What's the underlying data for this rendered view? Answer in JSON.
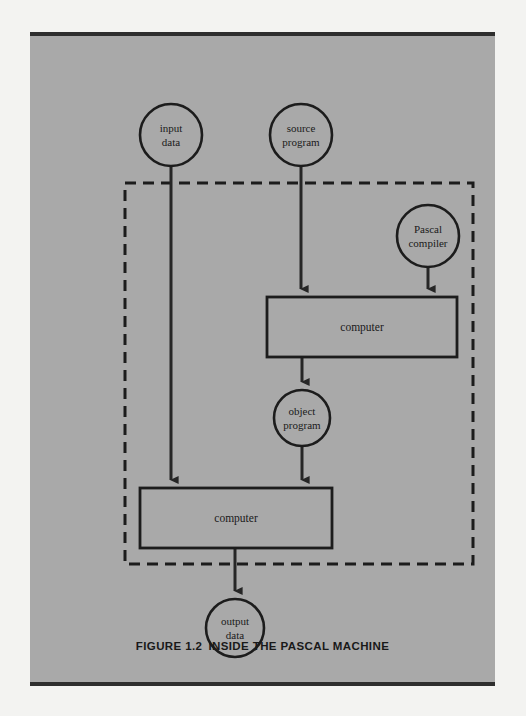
{
  "figure": {
    "caption_number": "FIGURE 1.2",
    "caption_title": "INSIDE THE PASCAL MACHINE",
    "panel_color": "#a9a9a9",
    "ink_color": "#1c1c1c",
    "page_color": "#f3f3f1"
  },
  "diagram": {
    "type": "flowchart",
    "nodes": [
      {
        "id": "input-data",
        "shape": "circle",
        "label_line1": "input",
        "label_line2": "data",
        "cx": 141,
        "cy": 99,
        "r": 31
      },
      {
        "id": "source-program",
        "shape": "circle",
        "label_line1": "source",
        "label_line2": "program",
        "cx": 271,
        "cy": 99,
        "r": 31
      },
      {
        "id": "pascal-compiler",
        "shape": "circle",
        "label_line1": "Pascal",
        "label_line2": "compiler",
        "cx": 398,
        "cy": 200,
        "r": 31
      },
      {
        "id": "computer-upper",
        "shape": "rect",
        "label_line1": "computer",
        "label_line2": "",
        "x": 237,
        "y": 261,
        "w": 190,
        "h": 60
      },
      {
        "id": "object-program",
        "shape": "circle",
        "label_line1": "object",
        "label_line2": "program",
        "cx": 272,
        "cy": 382,
        "r": 28
      },
      {
        "id": "computer-lower",
        "shape": "rect",
        "label_line1": "computer",
        "label_line2": "",
        "x": 110,
        "y": 452,
        "w": 192,
        "h": 60
      },
      {
        "id": "output-data",
        "shape": "circle",
        "label_line1": "output",
        "label_line2": "data",
        "cx": 205,
        "cy": 592,
        "r": 29
      }
    ],
    "edges": [
      {
        "id": "edge-input-to-computer-lower",
        "from": "input-data",
        "to": "computer-lower"
      },
      {
        "id": "edge-source-to-computer-upper",
        "from": "source-program",
        "to": "computer-upper"
      },
      {
        "id": "edge-compiler-to-computer-upper",
        "from": "pascal-compiler",
        "to": "computer-upper"
      },
      {
        "id": "edge-computer-upper-to-object",
        "from": "computer-upper",
        "to": "object-program"
      },
      {
        "id": "edge-object-to-computer-lower",
        "from": "object-program",
        "to": "computer-lower"
      },
      {
        "id": "edge-computer-lower-to-output",
        "from": "computer-lower",
        "to": "output-data"
      }
    ],
    "region": {
      "id": "pascal-machine-boundary",
      "style": "dashed",
      "x": 95,
      "y": 147,
      "w": 348,
      "h": 381
    }
  }
}
